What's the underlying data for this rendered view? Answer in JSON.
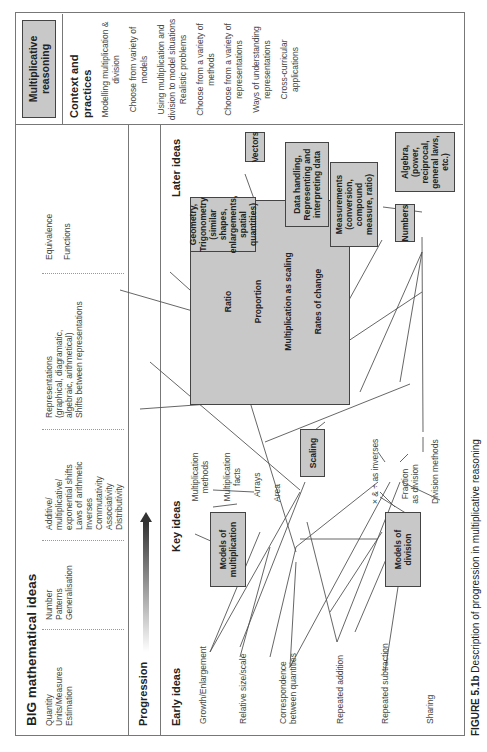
{
  "header": {
    "big_ideas_title": "BIG mathematical ideas",
    "big_ideas_columns": [
      [
        "Quantity",
        "Units/Measures",
        "Estimation"
      ],
      [
        "Number",
        "Patterns",
        "Generalisation"
      ],
      [
        "Additive/",
        "multiplicative/",
        "exponential shifts",
        "Laws of arithmetic",
        "Inverses",
        "Commutativity",
        "Associativity",
        "Distributivity"
      ],
      [
        "Representations",
        "(graphical, diagramatic,",
        "algebraic, arithmetical)",
        "Shifts between representations"
      ],
      [
        "Equivalence",
        "Functions"
      ]
    ],
    "topic_box": "Multiplicative reasoning"
  },
  "progression": {
    "label": "Progression"
  },
  "sections": {
    "early": "Early ideas",
    "key": "Key ideas",
    "later": "Later ideas",
    "context": "Context and practices"
  },
  "early_ideas": [
    "Growth/Enlargement",
    "Relative size/scale",
    "Correspondence between quantities",
    "Repeated addition",
    "Repeated subtraction",
    "Sharing"
  ],
  "key_boxes": {
    "models_multiplication": "Models of multiplication",
    "scaling": "Scaling",
    "models_division": "Models of division"
  },
  "key_labels": {
    "multiplication_methods": "Multiplication methods",
    "multiplication_facts": "Multiplication facts",
    "arrays": "Arrays",
    "area": "Area",
    "inverses": "× & ÷ as inverses",
    "fraction_division": "Fraction as division",
    "division_methods": "Division methods"
  },
  "central_box": [
    "Ratio",
    "Proportion",
    "Multiplication as scaling",
    "Rates of change"
  ],
  "later_boxes": {
    "geometry": "Geometry, Trigonometry (similar shapes, enlargements, spatial quantities)",
    "vectors": "Vectors",
    "data_handling": "Data handling, Representing and interpreting data",
    "measurements": "Measurements (conversion, compound measure, ratio)",
    "numbers": "Numbers",
    "algebra": "Algebra, (power, reciprocal, general laws, etc.)"
  },
  "context_items": [
    "Modelling multiplication & division",
    "Choose from variety of models",
    "Using multiplication and division to model situations",
    "Realistic problems",
    "Choose from a variety of methods",
    "Choose from a variety of representations",
    "Ways of understanding representations",
    "Cross-curricular applications"
  ],
  "caption": {
    "label": "FIGURE 5.1b",
    "text": "Description of progression in multiplicative reasoning"
  }
}
